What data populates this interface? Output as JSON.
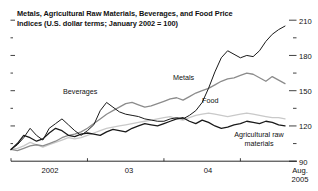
{
  "chart_data": {
    "type": "line",
    "title": "Metals, Agricultural Raw Materials, Beverages, and Food Price Indices (U.S. dollar terms; January 2002 = 100)",
    "title_line1": "Metals, Agricultural Raw Materials, Beverages, and Food Price",
    "title_line2": "Indices (U.S. dollar terms; January 2002 = 100)",
    "xlabel": "",
    "ylabel": "",
    "ylim": [
      90,
      210
    ],
    "yticks": [
      90,
      120,
      150,
      180,
      210
    ],
    "ytick_labels": [
      "90",
      "120",
      "150",
      "180",
      "210"
    ],
    "y_axis_position": "right",
    "grid": false,
    "legend_position": "inline-annotations",
    "xticks": [
      "2002",
      "03",
      "04",
      "2005"
    ],
    "xtick_labels": [
      "2002",
      "03",
      "04"
    ],
    "x_end_label_line1": "Aug.",
    "x_end_label_line2": "2005",
    "x_start": "Jan 2002",
    "x_end": "Aug 2005",
    "series": [
      {
        "name": "Beverages",
        "color": "#1a1a1a",
        "width": 1.0,
        "label_x": 63,
        "label_y": 90,
        "values": [
          100,
          104,
          110,
          118,
          112,
          108,
          118,
          122,
          126,
          121,
          116,
          112,
          116,
          121,
          133,
          140,
          136,
          132,
          130,
          129,
          128,
          126,
          125,
          124,
          124,
          126,
          127,
          126,
          129,
          133,
          140,
          152,
          166,
          178,
          184,
          181,
          178,
          180,
          179,
          184,
          192,
          198,
          202,
          205
        ]
      },
      {
        "name": "Metals",
        "color": "#8c8c8c",
        "width": 1.3,
        "label_x": 173,
        "label_y": 76,
        "values": [
          100,
          99,
          101,
          103,
          104,
          103,
          105,
          107,
          110,
          112,
          113,
          115,
          118,
          122,
          126,
          130,
          133,
          136,
          139,
          140,
          138,
          136,
          137,
          139,
          141,
          143,
          144,
          142,
          145,
          148,
          150,
          152,
          155,
          158,
          160,
          161,
          163,
          165,
          164,
          161,
          158,
          162,
          159,
          156
        ]
      },
      {
        "name": "Food",
        "color": "#c9c9c9",
        "width": 1.3,
        "label_x": 202,
        "label_y": 99,
        "values": [
          100,
          101,
          103,
          106,
          104,
          102,
          104,
          106,
          108,
          110,
          109,
          110,
          112,
          114,
          116,
          118,
          119,
          120,
          121,
          122,
          123,
          124,
          125,
          126,
          127,
          128,
          126,
          125,
          127,
          129,
          130,
          131,
          130,
          129,
          128,
          129,
          130,
          131,
          130,
          129,
          128,
          127,
          127,
          126
        ]
      },
      {
        "name": "Agricultural raw materials",
        "name_line1": "Agricultural raw",
        "name_line2": "materials",
        "color": "#1a1a1a",
        "width": 1.3,
        "label_x": 260,
        "label_y": 133,
        "values": [
          100,
          105,
          112,
          110,
          107,
          109,
          114,
          118,
          116,
          112,
          111,
          113,
          114,
          113,
          112,
          115,
          117,
          116,
          115,
          118,
          120,
          122,
          121,
          120,
          122,
          124,
          126,
          127,
          124,
          122,
          125,
          123,
          120,
          118,
          119,
          121,
          122,
          124,
          123,
          122,
          124,
          123,
          121,
          120
        ]
      }
    ]
  }
}
